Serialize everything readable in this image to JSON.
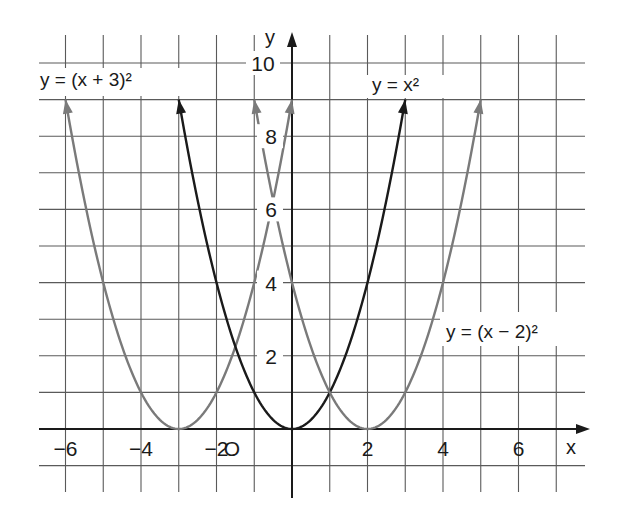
{
  "chart_data": {
    "type": "line",
    "title": "",
    "xlabel": "x",
    "ylabel": "y",
    "origin_label": "O",
    "xlim": [
      -7,
      7.8
    ],
    "ylim": [
      -1.8,
      10.8
    ],
    "grid": true,
    "x_ticks": [
      {
        "value": -6,
        "label": "−6"
      },
      {
        "value": -4,
        "label": "−4"
      },
      {
        "value": -2,
        "label": "−2"
      },
      {
        "value": 2,
        "label": "2"
      },
      {
        "value": 4,
        "label": "4"
      },
      {
        "value": 6,
        "label": "6"
      }
    ],
    "y_ticks": [
      {
        "value": 2,
        "label": "2"
      },
      {
        "value": 4,
        "label": "4"
      },
      {
        "value": 6,
        "label": "6"
      },
      {
        "value": 8,
        "label": "8"
      },
      {
        "value": 10,
        "label": "10"
      }
    ],
    "series": [
      {
        "name": "y = (x + 3)²",
        "label": "y = (x + 3)²",
        "formula": "(x+3)^2",
        "shift": -3,
        "domain": [
          -6,
          0
        ],
        "color": "#7a7a7a",
        "vertex": [
          -3,
          0
        ],
        "points": [
          [
            -6,
            9
          ],
          [
            -5,
            4
          ],
          [
            -4,
            1
          ],
          [
            -3,
            0
          ],
          [
            -2,
            1
          ],
          [
            -1,
            4
          ],
          [
            0,
            9
          ]
        ]
      },
      {
        "name": "y = x²",
        "label": "y = x²",
        "formula": "x^2",
        "shift": 0,
        "domain": [
          -3,
          3
        ],
        "color": "#1a1a1a",
        "vertex": [
          0,
          0
        ],
        "points": [
          [
            -3,
            9
          ],
          [
            -2,
            4
          ],
          [
            -1,
            1
          ],
          [
            0,
            0
          ],
          [
            1,
            1
          ],
          [
            2,
            4
          ],
          [
            3,
            9
          ]
        ]
      },
      {
        "name": "y = (x − 2)²",
        "label": "y = (x − 2)²",
        "formula": "(x-2)^2",
        "shift": 2,
        "domain": [
          -1,
          5
        ],
        "color": "#7a7a7a",
        "vertex": [
          2,
          0
        ],
        "points": [
          [
            -1,
            9
          ],
          [
            0,
            4
          ],
          [
            1,
            1
          ],
          [
            2,
            0
          ],
          [
            3,
            1
          ],
          [
            4,
            4
          ],
          [
            5,
            9
          ]
        ]
      }
    ],
    "annotations": [
      {
        "text": "y = (x + 3)²",
        "position": "top-left"
      },
      {
        "text": "y = x²",
        "position": "top-right"
      },
      {
        "text": "y = (x − 2)²",
        "position": "right-middle"
      }
    ]
  }
}
